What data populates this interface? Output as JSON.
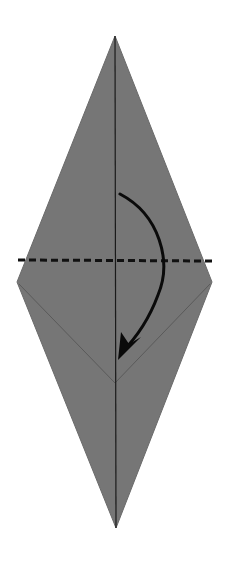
{
  "diagram": {
    "type": "origami-fold-step",
    "description": "Kite/diamond shape with a valley fold line; fold the top point down",
    "colors": {
      "paper": "#767676",
      "paper_edge": "#6a6a6a",
      "crease": "#1a1a1a",
      "inner_crease": "#5a5a5a",
      "fold_line": "#111111",
      "arrow": "#0a0a0a",
      "background": "#ffffff"
    },
    "shape": {
      "top_apex": [
        115,
        36
      ],
      "left_point": [
        17,
        282
      ],
      "right_point": [
        212,
        282
      ],
      "bottom_apex": [
        116,
        528
      ]
    },
    "center_crease": {
      "from": [
        115,
        36
      ],
      "to": [
        116,
        528
      ]
    },
    "inner_v_crease": {
      "left": [
        19,
        284
      ],
      "vertex": [
        115,
        383
      ],
      "right": [
        210,
        284
      ]
    },
    "fold_line": {
      "style": "dashed",
      "from": [
        18,
        260
      ],
      "to": [
        214,
        261
      ],
      "label": "valley-fold"
    },
    "arrow": {
      "start": [
        120,
        194
      ],
      "control": [
        185,
        250
      ],
      "end": [
        119,
        357
      ],
      "direction": "down"
    }
  }
}
